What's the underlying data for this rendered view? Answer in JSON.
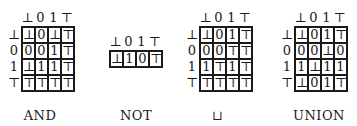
{
  "tables": [
    {
      "name": "and",
      "caption": "AND",
      "header": [
        "⊥",
        "0",
        "1",
        "⊤"
      ],
      "row_labels": [
        "⊥",
        "0",
        "1",
        "⊤"
      ],
      "rows": [
        [
          "⊥",
          "0",
          "⊥",
          "⊤"
        ],
        [
          "0",
          "0",
          "1",
          "⊤"
        ],
        [
          "⊥",
          "1",
          "1",
          "⊤"
        ],
        [
          "⊤",
          "⊤",
          "⊤",
          "⊤"
        ]
      ]
    },
    {
      "name": "not",
      "caption": "NOT",
      "header": [
        "⊥",
        "0",
        "1",
        "⊤"
      ],
      "row_labels": [],
      "rows": [
        [
          "⊥",
          "1",
          "0",
          "⊤"
        ]
      ]
    },
    {
      "name": "join",
      "caption": "⊔",
      "header": [
        "⊥",
        "0",
        "1",
        "⊤"
      ],
      "row_labels": [
        "⊥",
        "0",
        "1",
        "⊤"
      ],
      "rows": [
        [
          "⊥",
          "0",
          "1",
          "⊤"
        ],
        [
          "0",
          "0",
          "⊤",
          "⊤"
        ],
        [
          "1",
          "⊤",
          "1",
          "⊤"
        ],
        [
          "⊤",
          "⊤",
          "⊤",
          "⊤"
        ]
      ]
    },
    {
      "name": "union",
      "caption": "UNION",
      "header": [
        "⊥",
        "0",
        "1",
        "⊤"
      ],
      "row_labels": [
        "⊥",
        "0",
        "1",
        "⊤"
      ],
      "rows": [
        [
          "⊥",
          "0",
          "1",
          "⊤"
        ],
        [
          "0",
          "0",
          "⊥",
          "0"
        ],
        [
          "1",
          "⊥",
          "1",
          "1"
        ],
        [
          "⊥",
          "0",
          "1",
          "⊤"
        ]
      ]
    }
  ]
}
